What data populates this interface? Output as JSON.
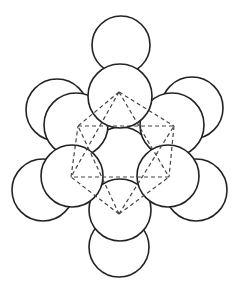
{
  "diagram": {
    "title": "Octahedral cluster of close-packed spheres",
    "colors": {
      "background": "#ffffff",
      "sphere_outline": "#222222",
      "sphere_fill": "#ffffff",
      "dashed_edge": "#444444"
    },
    "spheres": [
      {
        "id": "back-left",
        "cx": 57,
        "cy": 110,
        "r": 31
      },
      {
        "id": "back-right",
        "cx": 192,
        "cy": 108,
        "r": 31
      },
      {
        "id": "outer-lower-left",
        "cx": 43,
        "cy": 190,
        "r": 31
      },
      {
        "id": "outer-lower-right",
        "cx": 196,
        "cy": 190,
        "r": 31
      },
      {
        "id": "outer-top",
        "cx": 121,
        "cy": 45,
        "r": 29
      },
      {
        "id": "outer-bottom",
        "cx": 119,
        "cy": 247,
        "r": 30
      },
      {
        "id": "center",
        "cx": 121,
        "cy": 158,
        "r": 31
      },
      {
        "id": "front-upper-left",
        "cx": 76,
        "cy": 125,
        "r": 32
      },
      {
        "id": "front-upper-right",
        "cx": 172,
        "cy": 125,
        "r": 32
      },
      {
        "id": "inner-bottom",
        "cx": 120,
        "cy": 210,
        "r": 31
      },
      {
        "id": "inner-top",
        "cx": 120,
        "cy": 96,
        "r": 32
      },
      {
        "id": "front-lower-left",
        "cx": 72,
        "cy": 176,
        "r": 31
      },
      {
        "id": "front-lower-right",
        "cx": 168,
        "cy": 176,
        "r": 31
      }
    ],
    "octahedron_vertices": {
      "top": [
        119,
        92
      ],
      "upper_left": [
        78,
        126
      ],
      "upper_right": [
        174,
        126
      ],
      "lower_left": [
        71,
        177
      ],
      "lower_right": [
        169,
        177
      ],
      "bottom": [
        119,
        214
      ]
    },
    "octahedron_edges": [
      [
        "top",
        "upper_left"
      ],
      [
        "top",
        "upper_right"
      ],
      [
        "top",
        "lower_left"
      ],
      [
        "top",
        "lower_right"
      ],
      [
        "bottom",
        "upper_left"
      ],
      [
        "bottom",
        "upper_right"
      ],
      [
        "bottom",
        "lower_left"
      ],
      [
        "bottom",
        "lower_right"
      ],
      [
        "upper_left",
        "upper_right"
      ],
      [
        "upper_right",
        "lower_right"
      ],
      [
        "lower_right",
        "lower_left"
      ],
      [
        "lower_left",
        "upper_left"
      ]
    ]
  }
}
